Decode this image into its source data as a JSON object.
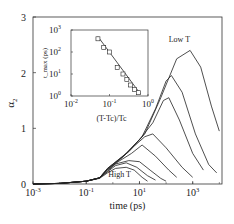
{
  "chart_data": {
    "type": "line",
    "title": "",
    "xlabel": "time (ps)",
    "ylabel": "α2",
    "xscale": "log",
    "xlim_log10": [
      -3,
      4.1
    ],
    "ylim": [
      0,
      3
    ],
    "x_ticks": [
      {
        "exp": -3,
        "label": "10",
        "sup": "-3"
      },
      {
        "exp": -1,
        "label": "10",
        "sup": "-1"
      },
      {
        "exp": 1,
        "label": "10",
        "sup": "1"
      },
      {
        "exp": 3,
        "label": "10",
        "sup": "3"
      }
    ],
    "y_ticks": [
      {
        "value": 0,
        "label": "0"
      },
      {
        "value": 1,
        "label": "1"
      },
      {
        "value": 2,
        "label": "2"
      },
      {
        "value": 3,
        "label": "3"
      }
    ],
    "grid": false,
    "annotations": [
      {
        "text": "Low T",
        "log10_x": 2.5,
        "y": 2.55
      },
      {
        "text": "High T",
        "log10_x": 0.25,
        "y": 0.12
      }
    ],
    "series": [
      {
        "name": "T1 (High T)",
        "points": [
          [
            -3,
            0
          ],
          [
            -2,
            0.01
          ],
          [
            -1,
            0.05
          ],
          [
            -0.5,
            0.1
          ],
          [
            -0.2,
            0.2
          ],
          [
            0.1,
            0.28
          ],
          [
            0.5,
            0.3
          ],
          [
            0.8,
            0.25
          ],
          [
            1.1,
            0.12
          ],
          [
            1.3,
            0.05
          ]
        ]
      },
      {
        "name": "T2",
        "points": [
          [
            -3,
            0
          ],
          [
            -2,
            0.01
          ],
          [
            -1,
            0.05
          ],
          [
            -0.5,
            0.11
          ],
          [
            -0.2,
            0.22
          ],
          [
            0.1,
            0.33
          ],
          [
            0.5,
            0.38
          ],
          [
            0.9,
            0.3
          ],
          [
            1.3,
            0.15
          ],
          [
            1.6,
            0.07
          ]
        ]
      },
      {
        "name": "T3",
        "points": [
          [
            -3,
            0
          ],
          [
            -2,
            0.01
          ],
          [
            -1,
            0.05
          ],
          [
            -0.5,
            0.11
          ],
          [
            -0.2,
            0.23
          ],
          [
            0.1,
            0.36
          ],
          [
            0.6,
            0.42
          ],
          [
            1.0,
            0.4
          ],
          [
            1.4,
            0.25
          ],
          [
            1.8,
            0.1
          ],
          [
            2.0,
            0.05
          ]
        ]
      },
      {
        "name": "T4",
        "points": [
          [
            -3,
            0
          ],
          [
            -2,
            0.01
          ],
          [
            -1,
            0.05
          ],
          [
            -0.5,
            0.11
          ],
          [
            -0.2,
            0.25
          ],
          [
            0.2,
            0.4
          ],
          [
            0.7,
            0.55
          ],
          [
            1.1,
            0.7
          ],
          [
            1.6,
            0.5
          ],
          [
            2.1,
            0.25
          ],
          [
            2.4,
            0.12
          ]
        ]
      },
      {
        "name": "T5",
        "points": [
          [
            -3,
            0
          ],
          [
            -2,
            0.01
          ],
          [
            -1,
            0.05
          ],
          [
            -0.5,
            0.11
          ],
          [
            -0.2,
            0.26
          ],
          [
            0.3,
            0.45
          ],
          [
            0.8,
            0.68
          ],
          [
            1.2,
            0.85
          ],
          [
            1.5,
            0.9
          ],
          [
            2.0,
            0.65
          ],
          [
            2.6,
            0.3
          ],
          [
            3.0,
            0.12
          ]
        ]
      },
      {
        "name": "T6",
        "points": [
          [
            -3,
            0
          ],
          [
            -2,
            0.01
          ],
          [
            -1,
            0.05
          ],
          [
            -0.5,
            0.11
          ],
          [
            -0.2,
            0.27
          ],
          [
            0.4,
            0.5
          ],
          [
            1.0,
            0.8
          ],
          [
            1.5,
            1.1
          ],
          [
            1.9,
            1.5
          ],
          [
            2.1,
            1.55
          ],
          [
            2.5,
            1.15
          ],
          [
            3.0,
            0.55
          ],
          [
            3.4,
            0.25
          ]
        ]
      },
      {
        "name": "T7",
        "points": [
          [
            -3,
            0
          ],
          [
            -2,
            0.01
          ],
          [
            -1,
            0.05
          ],
          [
            -0.5,
            0.11
          ],
          [
            -0.2,
            0.28
          ],
          [
            0.5,
            0.55
          ],
          [
            1.1,
            0.85
          ],
          [
            1.6,
            1.35
          ],
          [
            2.0,
            1.85
          ],
          [
            2.2,
            1.95
          ],
          [
            2.6,
            1.65
          ],
          [
            3.1,
            0.9
          ],
          [
            3.6,
            0.35
          ],
          [
            3.9,
            0.2
          ]
        ]
      },
      {
        "name": "T8 (Low T)",
        "points": [
          [
            -3,
            0
          ],
          [
            -2,
            0.01
          ],
          [
            -1,
            0.05
          ],
          [
            -0.5,
            0.11
          ],
          [
            -0.2,
            0.28
          ],
          [
            0.6,
            0.58
          ],
          [
            1.2,
            0.9
          ],
          [
            1.8,
            1.55
          ],
          [
            2.4,
            2.25
          ],
          [
            2.9,
            2.4
          ],
          [
            3.3,
            2.1
          ],
          [
            3.7,
            1.4
          ],
          [
            4.0,
            0.95
          ]
        ]
      }
    ],
    "inset": {
      "type": "scatter",
      "xlabel": "(T-Tc)/Tc",
      "ylabel": "t_max (ps)",
      "xscale": "log",
      "yscale": "log",
      "xlim_log10": [
        -2,
        0
      ],
      "ylim_log10": [
        0,
        3
      ],
      "x_ticks": [
        {
          "exp": -2,
          "label": "10",
          "sup": "-2"
        },
        {
          "exp": -1,
          "label": "10",
          "sup": "-1"
        },
        {
          "exp": 0,
          "label": "10",
          "sup": "0"
        }
      ],
      "y_ticks": [
        {
          "exp": 0,
          "label": "10",
          "sup": "0"
        },
        {
          "exp": 1,
          "label": "10",
          "sup": "1"
        },
        {
          "exp": 2,
          "label": "10",
          "sup": "2"
        },
        {
          "exp": 3,
          "label": "10",
          "sup": "3"
        }
      ],
      "points": [
        [
          -1.3,
          2.6
        ],
        [
          -1.15,
          2.2
        ],
        [
          -1.0,
          2.0
        ],
        [
          -0.8,
          1.3
        ],
        [
          -0.65,
          1.0
        ],
        [
          -0.55,
          0.75
        ],
        [
          -0.45,
          0.5
        ],
        [
          -0.35,
          0.3
        ],
        [
          -0.25,
          0.15
        ]
      ],
      "fit_line": [
        [
          -1.3,
          2.7
        ],
        [
          -0.2,
          0.1
        ]
      ]
    }
  }
}
